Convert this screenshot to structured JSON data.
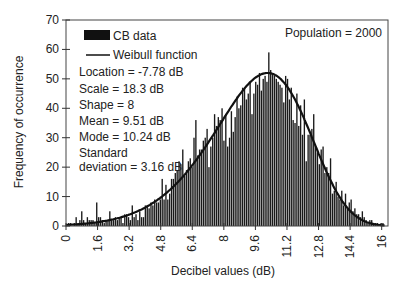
{
  "chart_data": {
    "type": "bar",
    "subtype": "histogram_with_fit",
    "title": "",
    "xlabel": "Decibel values (dB)",
    "ylabel": "Frequency of occurrence",
    "xlim": [
      0,
      16.32
    ],
    "ylim": [
      0,
      70
    ],
    "x_ticks": [
      "0",
      "1.6",
      "3.2",
      "4.8",
      "6.4",
      "8",
      "9.6",
      "11.2",
      "12.8",
      "14.4",
      "16"
    ],
    "x_tick_values": [
      0,
      1.6,
      3.2,
      4.8,
      6.4,
      8,
      9.6,
      11.2,
      12.8,
      14.4,
      16
    ],
    "y_ticks": [
      0,
      10,
      20,
      30,
      40,
      50,
      60,
      70
    ],
    "grid": false,
    "legend": [
      {
        "label": "CB data",
        "kind": "bar"
      },
      {
        "label": "Weibull function",
        "kind": "line"
      }
    ],
    "legend_position": "upper-left",
    "annotations": {
      "population": "Population = 2000",
      "stats": [
        "Location = -7.78 dB",
        "Scale = 18.3 dB",
        "Shape = 8",
        "Mean = 9.51 dB",
        "Mode = 10.24 dB",
        "Standard",
        "deviation = 3.16 dB"
      ]
    },
    "series": [
      {
        "name": "CB data",
        "bin_width": 0.16,
        "bin_start": 0,
        "values": [
          1,
          1,
          0,
          1,
          3,
          1,
          2,
          5,
          2,
          1,
          3,
          2,
          2,
          2,
          1,
          8,
          3,
          3,
          2,
          1,
          2,
          2,
          5,
          2,
          2,
          3,
          2,
          3,
          3,
          1,
          4,
          4,
          3,
          2,
          7,
          3,
          4,
          2,
          5,
          3,
          3,
          7,
          7,
          6,
          8,
          7,
          9,
          8,
          8,
          9,
          16,
          9,
          14,
          9,
          11,
          16,
          16,
          18,
          19,
          22,
          21,
          26,
          17,
          19,
          22,
          23,
          20,
          30,
          36,
          24,
          26,
          26,
          29,
          30,
          33,
          20,
          27,
          30,
          38,
          34,
          37,
          36,
          40,
          29,
          38,
          27,
          30,
          39,
          32,
          37,
          44,
          40,
          41,
          47,
          47,
          43,
          45,
          49,
          38,
          45,
          49,
          48,
          52,
          46,
          50,
          51,
          49,
          59,
          53,
          52,
          51,
          50,
          49,
          48,
          47,
          42,
          51,
          50,
          43,
          47,
          36,
          35,
          45,
          34,
          41,
          31,
          43,
          22,
          31,
          31,
          33,
          38,
          27,
          25,
          21,
          26,
          27,
          18,
          20,
          18,
          23,
          11,
          12,
          15,
          10,
          9,
          12,
          7,
          11,
          6,
          8,
          9,
          5,
          6,
          4,
          4,
          3,
          5,
          3,
          2,
          1,
          2,
          2,
          1,
          1,
          1,
          0,
          1,
          1,
          0
        ]
      },
      {
        "name": "Weibull function",
        "kind": "line",
        "location": -7.78,
        "scale": 18.3,
        "shape": 8,
        "peak_value": 52,
        "peak_x": 10.24
      }
    ],
    "colors": {
      "bar": "#1a1a1a",
      "line": "#111111",
      "axis": "#333333"
    }
  }
}
